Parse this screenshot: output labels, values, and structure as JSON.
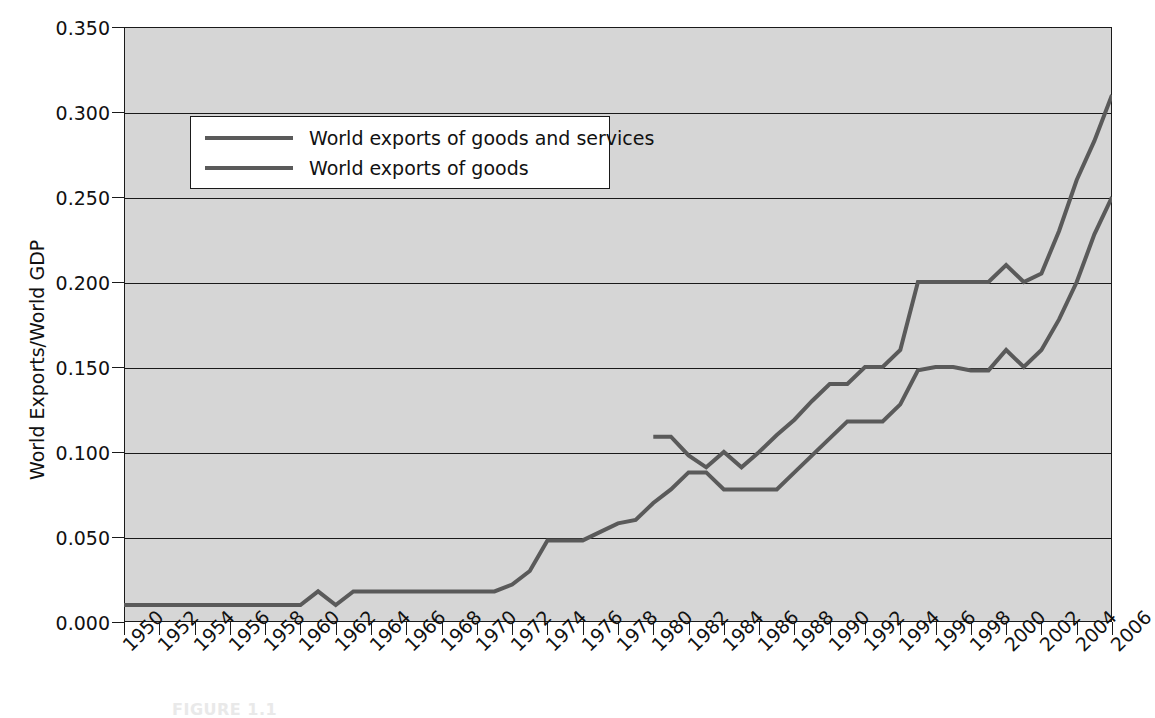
{
  "chart_data": {
    "type": "line",
    "title": "",
    "xlabel": "",
    "ylabel": "World Exports/World GDP",
    "xlim": [
      1950,
      2006
    ],
    "ylim": [
      0.0,
      0.35
    ],
    "grid": true,
    "legend_position": "upper-left",
    "ytick_labels": [
      "0.350",
      "0.300",
      "0.250",
      "0.200",
      "0.150",
      "0.100",
      "0.050",
      "0.000"
    ],
    "ytick_values": [
      0.35,
      0.3,
      0.25,
      0.2,
      0.15,
      0.1,
      0.05,
      0.0
    ],
    "xtick_labels": [
      "1950",
      "1952",
      "1954",
      "1956",
      "1958",
      "1960",
      "1962",
      "1964",
      "1966",
      "1968",
      "1970",
      "1972",
      "1974",
      "1976",
      "1978",
      "1980",
      "1982",
      "1984",
      "1986",
      "1988",
      "1990",
      "1992",
      "1994",
      "1996",
      "1998",
      "2000",
      "2002",
      "2004",
      "2006"
    ],
    "xtick_values": [
      1950,
      1952,
      1954,
      1956,
      1958,
      1960,
      1962,
      1964,
      1966,
      1968,
      1970,
      1972,
      1974,
      1976,
      1978,
      1980,
      1982,
      1984,
      1986,
      1988,
      1990,
      1992,
      1994,
      1996,
      1998,
      2000,
      2002,
      2004,
      2006
    ],
    "x": [
      1950,
      1951,
      1952,
      1953,
      1954,
      1955,
      1956,
      1957,
      1958,
      1959,
      1960,
      1961,
      1962,
      1963,
      1964,
      1965,
      1966,
      1967,
      1968,
      1969,
      1970,
      1971,
      1972,
      1973,
      1974,
      1975,
      1976,
      1977,
      1978,
      1979,
      1980,
      1981,
      1982,
      1983,
      1984,
      1985,
      1986,
      1987,
      1988,
      1989,
      1990,
      1991,
      1992,
      1993,
      1994,
      1995,
      1996,
      1997,
      1998,
      1999,
      2000,
      2001,
      2002,
      2003,
      2004,
      2005,
      2006
    ],
    "series": [
      {
        "name": "World exports of goods and services",
        "color": "#5a5a5a",
        "x_start": 1980,
        "values": [
          null,
          null,
          null,
          null,
          null,
          null,
          null,
          null,
          null,
          null,
          null,
          null,
          null,
          null,
          null,
          null,
          null,
          null,
          null,
          null,
          null,
          null,
          null,
          null,
          null,
          null,
          null,
          null,
          null,
          null,
          0.109,
          0.109,
          0.098,
          0.091,
          0.1,
          0.091,
          0.1,
          0.11,
          0.119,
          0.13,
          0.14,
          0.14,
          0.15,
          0.15,
          0.16,
          0.2,
          0.2,
          0.2,
          0.2,
          0.2,
          0.21,
          0.2,
          0.205,
          0.23,
          0.26,
          0.283,
          0.31
        ]
      },
      {
        "name": "World exports of goods",
        "color": "#5a5a5a",
        "x_start": 1950,
        "values": [
          0.01,
          0.01,
          0.01,
          0.01,
          0.01,
          0.01,
          0.01,
          0.01,
          0.01,
          0.01,
          0.01,
          0.018,
          0.01,
          0.018,
          0.018,
          0.018,
          0.018,
          0.018,
          0.018,
          0.018,
          0.018,
          0.018,
          0.022,
          0.03,
          0.048,
          0.048,
          0.048,
          0.053,
          0.058,
          0.06,
          0.07,
          0.078,
          0.088,
          0.088,
          0.078,
          0.078,
          0.078,
          0.078,
          0.088,
          0.098,
          0.108,
          0.118,
          0.118,
          0.118,
          0.128,
          0.148,
          0.15,
          0.15,
          0.148,
          0.148,
          0.16,
          0.15,
          0.16,
          0.178,
          0.2,
          0.228,
          0.25
        ]
      }
    ]
  },
  "legend": {
    "entries": [
      {
        "label": "World exports of goods and services"
      },
      {
        "label": "World exports of goods"
      }
    ]
  },
  "axes": {
    "y_title": "World Exports/World GDP"
  },
  "caption": {
    "text": "FIGURE 1.1"
  }
}
